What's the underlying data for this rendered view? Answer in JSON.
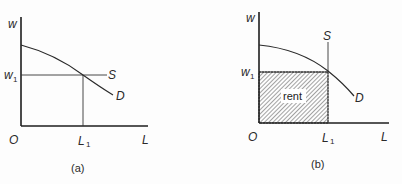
{
  "colors": {
    "ink": "#2a2a2a",
    "axis": "#1e1e1e",
    "background": "#fdfdfd",
    "hatch": "#555555"
  },
  "panels": [
    {
      "caption": "(a)",
      "y_axis_label": "w",
      "x_axis_label": "L",
      "origin_label": "O",
      "wage_tick": {
        "main": "w",
        "sub": "1"
      },
      "quantity_tick": {
        "main": "L",
        "sub": "1"
      },
      "supply_label": "S",
      "demand_label": "D",
      "supply_type": "horizontal (perfectly elastic)"
    },
    {
      "caption": "(b)",
      "y_axis_label": "w",
      "x_axis_label": "L",
      "origin_label": "O",
      "wage_tick": {
        "main": "w",
        "sub": "1"
      },
      "quantity_tick": {
        "main": "L",
        "sub": "1"
      },
      "supply_label": "S",
      "demand_label": "D",
      "supply_type": "vertical (perfectly inelastic)",
      "shaded_area_label": "rent"
    }
  ]
}
